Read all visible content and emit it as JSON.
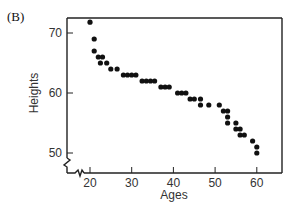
{
  "panel_label": "(B)",
  "chart_data": {
    "type": "scatter",
    "title": "",
    "xlabel": "Ages",
    "ylabel": "Heights",
    "xlim": [
      16,
      66
    ],
    "ylim": [
      46,
      73
    ],
    "x_ticks": [
      20,
      30,
      40,
      50,
      60
    ],
    "y_ticks": [
      50,
      60,
      70
    ],
    "grid": false,
    "legend": null,
    "axis_breaks": {
      "x": true,
      "y": true
    },
    "marker_color": "#111111",
    "points": [
      {
        "x": 20,
        "y": 71.8
      },
      {
        "x": 21,
        "y": 69
      },
      {
        "x": 21,
        "y": 67
      },
      {
        "x": 22,
        "y": 66
      },
      {
        "x": 23,
        "y": 66
      },
      {
        "x": 22.5,
        "y": 65
      },
      {
        "x": 24,
        "y": 65
      },
      {
        "x": 25,
        "y": 64
      },
      {
        "x": 26.5,
        "y": 64
      },
      {
        "x": 28,
        "y": 63
      },
      {
        "x": 29,
        "y": 63
      },
      {
        "x": 30,
        "y": 63
      },
      {
        "x": 31,
        "y": 63
      },
      {
        "x": 32.5,
        "y": 62
      },
      {
        "x": 33.5,
        "y": 62
      },
      {
        "x": 34.5,
        "y": 62
      },
      {
        "x": 35.5,
        "y": 62
      },
      {
        "x": 37,
        "y": 61
      },
      {
        "x": 38,
        "y": 61
      },
      {
        "x": 39,
        "y": 61
      },
      {
        "x": 41,
        "y": 60
      },
      {
        "x": 42,
        "y": 60
      },
      {
        "x": 43,
        "y": 60
      },
      {
        "x": 44,
        "y": 59
      },
      {
        "x": 45,
        "y": 59
      },
      {
        "x": 46.5,
        "y": 59
      },
      {
        "x": 46.5,
        "y": 58
      },
      {
        "x": 48.5,
        "y": 58
      },
      {
        "x": 51,
        "y": 58
      },
      {
        "x": 52,
        "y": 57
      },
      {
        "x": 53,
        "y": 57
      },
      {
        "x": 53,
        "y": 56
      },
      {
        "x": 53,
        "y": 55
      },
      {
        "x": 55,
        "y": 55
      },
      {
        "x": 55,
        "y": 54
      },
      {
        "x": 56,
        "y": 54
      },
      {
        "x": 56,
        "y": 53
      },
      {
        "x": 57,
        "y": 53
      },
      {
        "x": 59,
        "y": 52
      },
      {
        "x": 60,
        "y": 51
      },
      {
        "x": 60,
        "y": 50
      }
    ]
  }
}
